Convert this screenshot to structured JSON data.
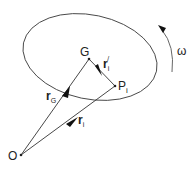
{
  "diagram": {
    "title": "",
    "colors": {
      "stroke": "#333333",
      "background": "#ffffff"
    },
    "points": {
      "O": {
        "label": "O",
        "x": 21,
        "y": 155
      },
      "G": {
        "label": "G",
        "x": 89,
        "y": 59
      },
      "P": {
        "label": "P",
        "sub": "i",
        "x": 115,
        "y": 86
      }
    },
    "vectors": {
      "rG": {
        "label": "r",
        "sub": "G",
        "from": "O",
        "to": "G"
      },
      "ri": {
        "label": "r",
        "sub": "i",
        "from": "O",
        "to": "P"
      },
      "ri_prime": {
        "label": "r",
        "sub": "i",
        "sup": "/",
        "from": "G",
        "to": "P"
      }
    },
    "body": {
      "shape": "ellipse",
      "cx": 90,
      "cy": 57,
      "rx": 68,
      "ry": 43,
      "rotate": 12
    },
    "rotation": {
      "label": "ω",
      "direction": "counter-clockwise"
    }
  }
}
